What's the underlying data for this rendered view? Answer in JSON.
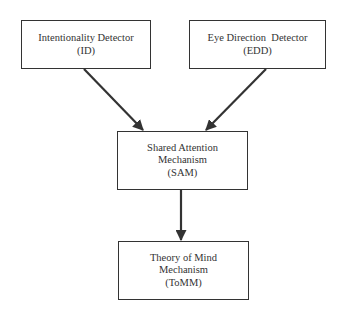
{
  "diagram": {
    "type": "flowchart",
    "nodes": [
      {
        "id": "ID",
        "lines": [
          "Intentionality Detector",
          "(ID)"
        ]
      },
      {
        "id": "EDD",
        "lines": [
          "Eye Direction  Detector",
          "(EDD)"
        ]
      },
      {
        "id": "SAM",
        "lines": [
          "Shared Attention",
          "Mechanism",
          "(SAM)"
        ]
      },
      {
        "id": "ToMM",
        "lines": [
          "Theory of Mind",
          "Mechanism",
          "(ToMM)"
        ]
      }
    ],
    "edges": [
      {
        "from": "ID",
        "to": "SAM"
      },
      {
        "from": "EDD",
        "to": "SAM"
      },
      {
        "from": "SAM",
        "to": "ToMM"
      }
    ],
    "colors": {
      "stroke": "#333333",
      "background": "#ffffff"
    }
  }
}
